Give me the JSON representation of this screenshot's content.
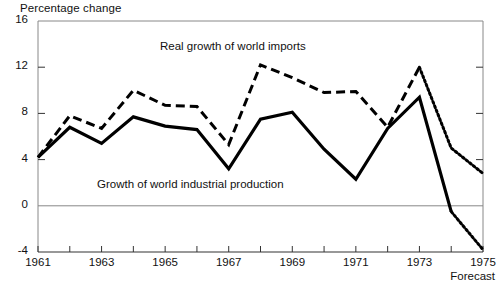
{
  "chart_data": {
    "type": "line",
    "title": "",
    "ylabel": "Percentage change",
    "xlabel": "",
    "x": [
      1961,
      1962,
      1963,
      1964,
      1965,
      1966,
      1967,
      1968,
      1969,
      1970,
      1971,
      1972,
      1973,
      1974,
      1975
    ],
    "xtick_labels": [
      "1961",
      "1963",
      "1965",
      "1967",
      "1969",
      "1971",
      "1973",
      "1975"
    ],
    "xticks": [
      1961,
      1963,
      1965,
      1967,
      1969,
      1971,
      1973,
      1975
    ],
    "ytick_labels": [
      "16",
      "12",
      "8",
      "4",
      "0",
      "-4"
    ],
    "yticks": [
      16,
      12,
      8,
      4,
      0,
      -4
    ],
    "ylim": [
      -4,
      16
    ],
    "xlim": [
      1961,
      1975
    ],
    "grid": false,
    "zero_line": true,
    "legend_position": "inline-annotations",
    "forecast_from": 1973,
    "forecast_note": "Forecast",
    "series": [
      {
        "name": "Real growth of world imports",
        "style": "dashed",
        "color": "#000000",
        "values": [
          4.2,
          7.8,
          6.7,
          10.0,
          8.7,
          8.6,
          5.3,
          12.2,
          11.1,
          9.8,
          9.9,
          6.8,
          12.0,
          5.0,
          2.8
        ],
        "forecast_values": [
          12.0,
          5.0,
          2.8
        ],
        "forecast_x": [
          1973,
          1974,
          1975
        ],
        "forecast_style": "dotted"
      },
      {
        "name": "Growth of world industrial production",
        "style": "solid",
        "color": "#000000",
        "values": [
          4.2,
          6.8,
          5.4,
          7.7,
          6.9,
          6.6,
          3.2,
          7.5,
          8.1,
          4.9,
          2.3,
          6.7,
          9.4,
          -0.5,
          -3.8
        ],
        "forecast_values": [
          -0.5,
          -3.8
        ],
        "forecast_x": [
          1974,
          1975
        ],
        "forecast_style": "dotted"
      }
    ]
  },
  "labels": {
    "y_axis_title": "Percentage change",
    "imports_annotation": "Real growth of world imports",
    "production_annotation": "Growth of world industrial production",
    "forecast_annotation": "Forecast"
  }
}
